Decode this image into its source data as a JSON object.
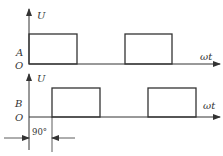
{
  "diagram": {
    "title": "",
    "top_plot": {
      "y_axis_label": "U",
      "signal_label": "A",
      "origin_label": "O",
      "x_axis_label": "ωt",
      "pulses": [
        [
          29,
          77
        ],
        [
          125,
          172
        ]
      ]
    },
    "bottom_plot": {
      "y_axis_label": "U",
      "signal_label": "B",
      "origin_label": "O",
      "x_axis_label": "ωt",
      "pulses": [
        [
          52,
          100
        ],
        [
          148,
          196
        ]
      ]
    },
    "phase_shift_label": "90°",
    "colors": {
      "line": "#333333",
      "background": "#ffffff"
    }
  }
}
